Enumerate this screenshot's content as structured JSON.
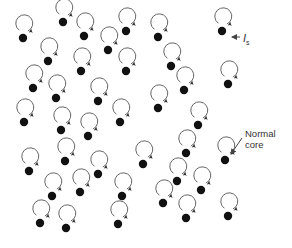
{
  "diagram": {
    "labels": {
      "current_symbol": "I",
      "current_subscript": "s",
      "normal_core_line1": "Normal",
      "normal_core_line2": "core"
    },
    "colors": {
      "core": "#111111",
      "ring": "#555555",
      "text": "#333333"
    },
    "vortices": [
      [
        63,
        22
      ],
      [
        23,
        38
      ],
      [
        84,
        36
      ],
      [
        126,
        31
      ],
      [
        108,
        50
      ],
      [
        48,
        61
      ],
      [
        81,
        71
      ],
      [
        126,
        71
      ],
      [
        33,
        88
      ],
      [
        56,
        98
      ],
      [
        98,
        101
      ],
      [
        24,
        122
      ],
      [
        61,
        130
      ],
      [
        88,
        136
      ],
      [
        120,
        122
      ],
      [
        65,
        161
      ],
      [
        29,
        171
      ],
      [
        98,
        174
      ],
      [
        52,
        196
      ],
      [
        80,
        192
      ],
      [
        122,
        196
      ],
      [
        40,
        223
      ],
      [
        66,
        228
      ],
      [
        118,
        224
      ],
      [
        143,
        164
      ],
      [
        158,
        37
      ],
      [
        171,
        66
      ],
      [
        184,
        90
      ],
      [
        158,
        108
      ],
      [
        222,
        31
      ],
      [
        228,
        84
      ],
      [
        198,
        125
      ],
      [
        186,
        153
      ],
      [
        225,
        160
      ],
      [
        177,
        181
      ],
      [
        201,
        190
      ],
      [
        163,
        203
      ],
      [
        186,
        218
      ],
      [
        228,
        216
      ]
    ]
  }
}
